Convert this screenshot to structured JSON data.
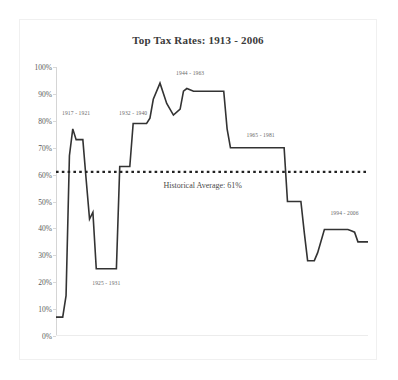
{
  "chart_data": {
    "type": "line",
    "title": "Top Tax Rates:  1913 - 2006",
    "xlabel": "",
    "ylabel": "",
    "ylim": [
      0,
      100
    ],
    "xlim": [
      1913,
      2006
    ],
    "grid": false,
    "legend": "none",
    "ytick_labels": [
      "100%",
      "90%",
      "80%",
      "70%",
      "60%",
      "50%",
      "40%",
      "30%",
      "20%",
      "10%",
      "0%"
    ],
    "ytick_values": [
      100,
      90,
      80,
      70,
      60,
      50,
      40,
      30,
      20,
      10,
      0
    ],
    "xtick_labels": [],
    "series": [
      {
        "name": "Top marginal tax rate",
        "color": "#333333",
        "x": [
          1913,
          1915,
          1916,
          1917,
          1918,
          1919,
          1921,
          1922,
          1923,
          1924,
          1925,
          1931,
          1932,
          1935,
          1936,
          1940,
          1941,
          1942,
          1944,
          1946,
          1948,
          1950,
          1951,
          1952,
          1954,
          1963,
          1964,
          1965,
          1981,
          1982,
          1986,
          1987,
          1988,
          1990,
          1991,
          1993,
          1994,
          2000,
          2001,
          2002,
          2003,
          2006
        ],
        "values": [
          7,
          7,
          15,
          67,
          77,
          73,
          73,
          58,
          43.5,
          46,
          25,
          25,
          63,
          63,
          79,
          79,
          81,
          88,
          94,
          86.45,
          82.13,
          84.36,
          91,
          92,
          91,
          91,
          77,
          70,
          70,
          50,
          50,
          38.5,
          28,
          28,
          31,
          39.6,
          39.6,
          39.6,
          39.1,
          38.6,
          35,
          35
        ]
      }
    ],
    "reference_line": {
      "label": "Historical Average:  61%",
      "value": 61,
      "style": "dotted",
      "color": "#222222"
    },
    "annotations": [
      {
        "label": "1917 - 1921",
        "x": 1919,
        "y": 82,
        "position": "above"
      },
      {
        "label": "1925 - 1931",
        "x": 1928,
        "y": 19,
        "position": "below"
      },
      {
        "label": "1932 - 1940",
        "x": 1936,
        "y": 82,
        "position": "above"
      },
      {
        "label": "1944 - 1963",
        "x": 1953,
        "y": 97,
        "position": "above"
      },
      {
        "label": "1965 - 1981",
        "x": 1974,
        "y": 74,
        "position": "above"
      },
      {
        "label": "1994 - 2006",
        "x": 1999,
        "y": 45,
        "position": "above"
      }
    ]
  }
}
